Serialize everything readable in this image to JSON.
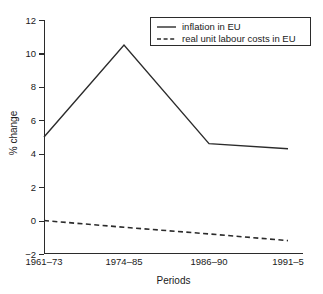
{
  "chart_data": {
    "type": "line",
    "title": "",
    "subtitle": "",
    "xlabel": "Periods",
    "ylabel": "% change",
    "categories": [
      "1961–73",
      "1974–85",
      "1986–90",
      "1991–5"
    ],
    "yticks": [
      12,
      10,
      8,
      6,
      4,
      2,
      0,
      -2
    ],
    "ytick_labels": [
      "12",
      "10",
      "8",
      "6",
      "4",
      "2",
      "0",
      "−2"
    ],
    "ylim": [
      -2,
      12
    ],
    "grid": false,
    "legend_position": "top-right",
    "series": [
      {
        "name": "inflation in EU",
        "style": "solid",
        "color": "#2b2b2b",
        "values": [
          5.0,
          10.5,
          4.6,
          4.3
        ]
      },
      {
        "name": "real unit labour costs in EU",
        "style": "dashed",
        "color": "#2b2b2b",
        "values": [
          0.0,
          -0.4,
          -0.8,
          -1.2
        ]
      }
    ]
  },
  "legend": {
    "entries": [
      {
        "label": "inflation in EU",
        "style": "solid"
      },
      {
        "label": "real unit labour costs in EU",
        "style": "dashed"
      }
    ]
  },
  "axes": {
    "y_title": "% change",
    "x_title": "Periods"
  }
}
